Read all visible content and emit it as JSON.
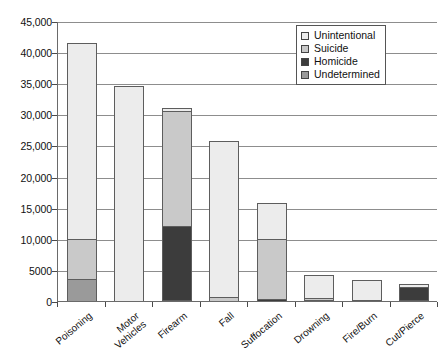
{
  "chart_data": {
    "type": "bar",
    "subtype": "stacked-vertical",
    "title": "",
    "xlabel": "",
    "ylabel": "",
    "ylim": [
      0,
      45000
    ],
    "ytick_labels": [
      "45,000",
      "40,000",
      "35,000",
      "30,000",
      "25,000",
      "20,000",
      "15,000",
      "10,000",
      "5000",
      "0"
    ],
    "ytick_values": [
      45000,
      40000,
      35000,
      30000,
      25000,
      20000,
      15000,
      10000,
      5000,
      0
    ],
    "grid": true,
    "legend_position": "top-right",
    "categories": [
      "Poisoning",
      "Motor\nVehicles",
      "Firearm",
      "Fall",
      "Suffocation",
      "Drowning",
      "Fire/Burn",
      "Cut/Pierce"
    ],
    "series": [
      {
        "name": "Unintentional",
        "color": "#ececec",
        "values": [
          31500,
          34600,
          400,
          25000,
          5800,
          3700,
          3200,
          400
        ]
      },
      {
        "name": "Suicide",
        "color": "#c9c9c9",
        "values": [
          6500,
          0,
          18500,
          700,
          9600,
          350,
          100,
          0
        ]
      },
      {
        "name": "Homicide",
        "color": "#3c3c3c",
        "values": [
          0,
          0,
          12000,
          0,
          400,
          0,
          0,
          2200
        ]
      },
      {
        "name": "Undetermined",
        "color": "#9a9a9a",
        "values": [
          3500,
          0,
          100,
          0,
          0,
          150,
          0,
          100
        ]
      }
    ],
    "totals": [
      41500,
      34600,
      31000,
      25700,
      15800,
      4200,
      3300,
      2700
    ]
  },
  "legend": {
    "items": [
      {
        "label": "Unintentional",
        "swatch": "#ececec"
      },
      {
        "label": "Suicide",
        "swatch": "#c9c9c9"
      },
      {
        "label": "Homicide",
        "swatch": "#3c3c3c"
      },
      {
        "label": "Undetermined",
        "swatch": "#9a9a9a"
      }
    ]
  }
}
